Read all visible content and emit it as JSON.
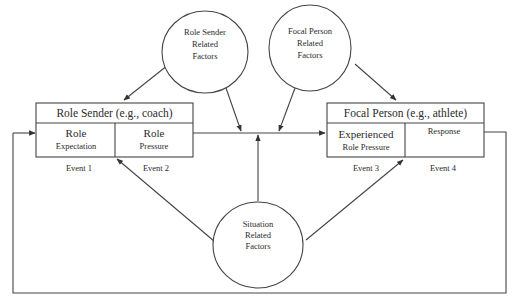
{
  "diagram": {
    "type": "process-model",
    "nodes": {
      "role_sender_factors": {
        "lines": [
          "Role Sender",
          "Related",
          "Factors"
        ]
      },
      "focal_person_factors": {
        "lines": [
          "Focal Person",
          "Related",
          "Factors"
        ]
      },
      "situation_factors": {
        "lines": [
          "Situation",
          "Related",
          "Factors"
        ]
      },
      "role_sender": {
        "title": "Role Sender (e.g., coach)",
        "cells": [
          {
            "line1": "Role",
            "line2": "Expectation"
          },
          {
            "line1": "Role",
            "line2": "Pressure"
          }
        ]
      },
      "focal_person": {
        "title": "Focal Person (e.g., athlete)",
        "cells": [
          {
            "line1": "Experienced",
            "line2": "Role Pressure"
          },
          {
            "line1": "Response",
            "line2": ""
          }
        ]
      }
    },
    "events": [
      "Event 1",
      "Event 2",
      "Event 3",
      "Event 4"
    ],
    "edges": [
      {
        "from": "role_sender_factors",
        "to": "role_sender"
      },
      {
        "from": "role_sender_factors",
        "to": "transmission_line"
      },
      {
        "from": "focal_person_factors",
        "to": "transmission_line"
      },
      {
        "from": "focal_person_factors",
        "to": "focal_person"
      },
      {
        "from": "situation_factors",
        "to": "transmission_line"
      },
      {
        "from": "situation_factors",
        "to": "role_sender"
      },
      {
        "from": "situation_factors",
        "to": "focal_person"
      },
      {
        "from": "role_sender",
        "to": "focal_person",
        "label": ""
      },
      {
        "from": "focal_person",
        "to": "role_sender",
        "label": "feedback loop"
      }
    ]
  }
}
